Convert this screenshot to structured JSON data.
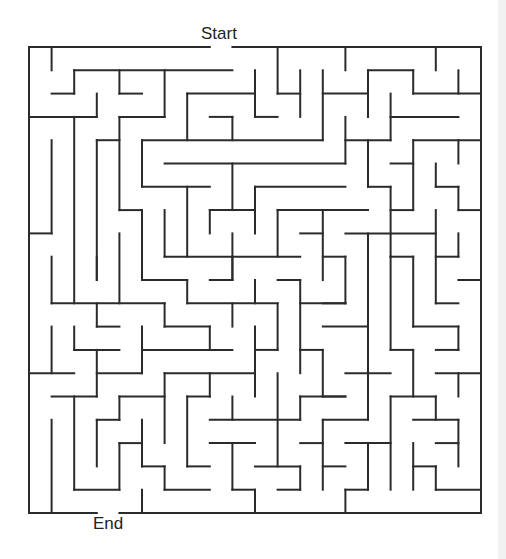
{
  "labels": {
    "start": "Start",
    "end": "End"
  },
  "colors": {
    "wall": "#2b2b2b",
    "background": "#ffffff"
  },
  "maze": {
    "cols": 20,
    "rows": 20,
    "entrance": {
      "side": "top",
      "cell": 8
    },
    "exit": {
      "side": "bottom",
      "cell": 3
    },
    "walls": [
      [
        0,
        0,
        8,
        0
      ],
      [
        9,
        0,
        20,
        0
      ],
      [
        0,
        0,
        0,
        20
      ],
      [
        20,
        0,
        20,
        20
      ],
      [
        0,
        20,
        3,
        20
      ],
      [
        4,
        20,
        20,
        20
      ],
      [
        1,
        0,
        1,
        1
      ],
      [
        2,
        1,
        9,
        1
      ],
      [
        2,
        1,
        2,
        2
      ],
      [
        1,
        2,
        2,
        2
      ],
      [
        3,
        2,
        3,
        3
      ],
      [
        0,
        3,
        3,
        3
      ],
      [
        4,
        1,
        4,
        2
      ],
      [
        4,
        2,
        5,
        2
      ],
      [
        6,
        1,
        6,
        3
      ],
      [
        4,
        3,
        6,
        3
      ],
      [
        4,
        3,
        4,
        7
      ],
      [
        4,
        7,
        5,
        7
      ],
      [
        5,
        7,
        5,
        10
      ],
      [
        2,
        3,
        2,
        11
      ],
      [
        1,
        4,
        1,
        8
      ],
      [
        0,
        8,
        1,
        8
      ],
      [
        3,
        4,
        4,
        4
      ],
      [
        3,
        4,
        3,
        10
      ],
      [
        5,
        4,
        13,
        4
      ],
      [
        5,
        4,
        5,
        6
      ],
      [
        5,
        6,
        8,
        6
      ],
      [
        7,
        2,
        7,
        4
      ],
      [
        7,
        2,
        10,
        2
      ],
      [
        8,
        3,
        9,
        3
      ],
      [
        9,
        3,
        9,
        4
      ],
      [
        10,
        1,
        10,
        3
      ],
      [
        10,
        3,
        11,
        3
      ],
      [
        11,
        0,
        11,
        2
      ],
      [
        11,
        2,
        12,
        2
      ],
      [
        12,
        1,
        12,
        3
      ],
      [
        13,
        1,
        13,
        4
      ],
      [
        13,
        2,
        15,
        2
      ],
      [
        14,
        0,
        14,
        1
      ],
      [
        6,
        5,
        14,
        5
      ],
      [
        14,
        3,
        14,
        5
      ],
      [
        14,
        4,
        16,
        4
      ],
      [
        9,
        5,
        9,
        7
      ],
      [
        6,
        7,
        6,
        9
      ],
      [
        7,
        6,
        7,
        9
      ],
      [
        6,
        9,
        12,
        9
      ],
      [
        10,
        6,
        10,
        8
      ],
      [
        10,
        6,
        14,
        6
      ],
      [
        8,
        7,
        10,
        7
      ],
      [
        8,
        7,
        8,
        8
      ],
      [
        9,
        8,
        9,
        10
      ],
      [
        8,
        10,
        9,
        10
      ],
      [
        11,
        7,
        11,
        9
      ],
      [
        11,
        7,
        15,
        7
      ],
      [
        13,
        7,
        13,
        10
      ],
      [
        12,
        8,
        13,
        8
      ],
      [
        13,
        9,
        14,
        9
      ],
      [
        14,
        9,
        14,
        11
      ],
      [
        13,
        11,
        14,
        11
      ],
      [
        15,
        1,
        15,
        3
      ],
      [
        15,
        1,
        17,
        1
      ],
      [
        17,
        1,
        17,
        2
      ],
      [
        17,
        2,
        20,
        2
      ],
      [
        19,
        1,
        19,
        2
      ],
      [
        18,
        0,
        18,
        1
      ],
      [
        16,
        2,
        16,
        4
      ],
      [
        16,
        3,
        19,
        3
      ],
      [
        15,
        4,
        15,
        5
      ],
      [
        17,
        4,
        20,
        4
      ],
      [
        17,
        4,
        17,
        7
      ],
      [
        19,
        4,
        19,
        5
      ],
      [
        16,
        5,
        17,
        5
      ],
      [
        15,
        5,
        15,
        6
      ],
      [
        15,
        6,
        16,
        6
      ],
      [
        16,
        6,
        16,
        9
      ],
      [
        16,
        7,
        17,
        7
      ],
      [
        18,
        5,
        18,
        6
      ],
      [
        18,
        6,
        19,
        6
      ],
      [
        19,
        6,
        19,
        7
      ],
      [
        19,
        7,
        20,
        7
      ],
      [
        14,
        8,
        18,
        8
      ],
      [
        18,
        7,
        18,
        11
      ],
      [
        18,
        11,
        19,
        11
      ],
      [
        15,
        8,
        15,
        16
      ],
      [
        13,
        16,
        15,
        16
      ],
      [
        16,
        9,
        17,
        9
      ],
      [
        16,
        9,
        16,
        13
      ],
      [
        16,
        13,
        17,
        13
      ],
      [
        17,
        9,
        17,
        12
      ],
      [
        17,
        12,
        19,
        12
      ],
      [
        19,
        12,
        19,
        13
      ],
      [
        18,
        13,
        19,
        13
      ],
      [
        18,
        9,
        19,
        9
      ],
      [
        19,
        8,
        19,
        9
      ],
      [
        19,
        10,
        20,
        10
      ],
      [
        13,
        12,
        15,
        12
      ],
      [
        14,
        14,
        16,
        14
      ],
      [
        18,
        14,
        20,
        14
      ],
      [
        19,
        14,
        19,
        15
      ],
      [
        17,
        13,
        17,
        15
      ],
      [
        16,
        15,
        18,
        15
      ],
      [
        16,
        15,
        16,
        19
      ],
      [
        18,
        15,
        18,
        16
      ],
      [
        17,
        16,
        19,
        16
      ],
      [
        19,
        16,
        19,
        18
      ],
      [
        13,
        15,
        14,
        15
      ],
      [
        13,
        16,
        13,
        19
      ],
      [
        13,
        18,
        14,
        18
      ],
      [
        14,
        17,
        16,
        17
      ],
      [
        15,
        17,
        15,
        19
      ],
      [
        14,
        19,
        15,
        19
      ],
      [
        14,
        19,
        14,
        20
      ],
      [
        17,
        17,
        17,
        19
      ],
      [
        18,
        17,
        19,
        17
      ],
      [
        17,
        18,
        18,
        18
      ],
      [
        18,
        18,
        18,
        19
      ],
      [
        18,
        19,
        20,
        19
      ],
      [
        9,
        9,
        9,
        10
      ],
      [
        5,
        10,
        7,
        10
      ],
      [
        7,
        10,
        7,
        11
      ],
      [
        7,
        11,
        11,
        11
      ],
      [
        10,
        10,
        10,
        11
      ],
      [
        9,
        11,
        9,
        12
      ],
      [
        11,
        11,
        11,
        13
      ],
      [
        10,
        13,
        11,
        13
      ],
      [
        10,
        12,
        10,
        15
      ],
      [
        11,
        10,
        12,
        10
      ],
      [
        12,
        10,
        12,
        14
      ],
      [
        12,
        11,
        14,
        11
      ],
      [
        6,
        11,
        6,
        12
      ],
      [
        6,
        12,
        8,
        12
      ],
      [
        8,
        12,
        8,
        13
      ],
      [
        5,
        13,
        9,
        13
      ],
      [
        12,
        13,
        13,
        13
      ],
      [
        13,
        13,
        13,
        15
      ],
      [
        6,
        14,
        10,
        14
      ],
      [
        8,
        14,
        8,
        15
      ],
      [
        11,
        14,
        11,
        18
      ],
      [
        6,
        14,
        6,
        17
      ],
      [
        7,
        15,
        8,
        15
      ],
      [
        7,
        15,
        7,
        18
      ],
      [
        7,
        18,
        8,
        18
      ],
      [
        9,
        15,
        9,
        16
      ],
      [
        8,
        16,
        12,
        16
      ],
      [
        12,
        15,
        12,
        16
      ],
      [
        12,
        15,
        14,
        15
      ],
      [
        8,
        17,
        10,
        17
      ],
      [
        9,
        17,
        9,
        19
      ],
      [
        9,
        19,
        10,
        19
      ],
      [
        10,
        19,
        10,
        20
      ],
      [
        6,
        19,
        8,
        19
      ],
      [
        6,
        18,
        6,
        19
      ],
      [
        10,
        18,
        12,
        18
      ],
      [
        12,
        18,
        12,
        19
      ],
      [
        11,
        19,
        12,
        19
      ],
      [
        12,
        17,
        13,
        17
      ],
      [
        1,
        9,
        1,
        11
      ],
      [
        1,
        11,
        6,
        11
      ],
      [
        3,
        9,
        3,
        10
      ],
      [
        4,
        8,
        4,
        11
      ],
      [
        3,
        11,
        3,
        12
      ],
      [
        3,
        12,
        4,
        12
      ],
      [
        1,
        12,
        1,
        14
      ],
      [
        0,
        14,
        2,
        14
      ],
      [
        2,
        12,
        2,
        13
      ],
      [
        2,
        13,
        4,
        13
      ],
      [
        3,
        13,
        3,
        15
      ],
      [
        1,
        15,
        3,
        15
      ],
      [
        3,
        14,
        5,
        14
      ],
      [
        5,
        12,
        5,
        14
      ],
      [
        2,
        15,
        2,
        19
      ],
      [
        2,
        19,
        4,
        19
      ],
      [
        1,
        16,
        1,
        20
      ],
      [
        3,
        16,
        3,
        18
      ],
      [
        3,
        16,
        4,
        16
      ],
      [
        4,
        15,
        4,
        16
      ],
      [
        4,
        15,
        6,
        15
      ],
      [
        4,
        17,
        4,
        19
      ],
      [
        4,
        17,
        5,
        17
      ],
      [
        5,
        16,
        5,
        18
      ],
      [
        5,
        18,
        6,
        18
      ],
      [
        5,
        19,
        5,
        20
      ]
    ]
  }
}
